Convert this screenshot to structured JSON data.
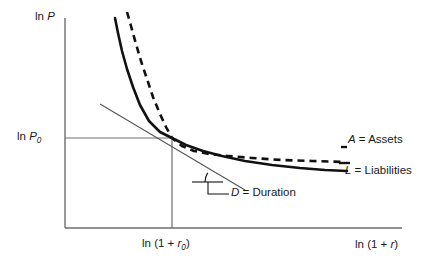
{
  "chart_data": {
    "type": "line",
    "title": "",
    "subtitle": "",
    "xlabel": "ln (1 + r)",
    "ylabel": "ln P",
    "xlim": [
      0,
      1
    ],
    "ylim": [
      0,
      1
    ],
    "grid": false,
    "legend_position": "right-inline",
    "axes": {
      "y_axis_label": "ln P",
      "x_axis_label": "ln (1 + r)",
      "y_tick_labels": [
        "ln P",
        "ln P_0"
      ],
      "x_tick_labels": [
        "ln (1 + r_0)",
        "ln (1 + r)"
      ],
      "origin_px": [
        65,
        228
      ],
      "x_axis_end_px": [
        402,
        228
      ],
      "y_axis_top_px": [
        65,
        18
      ]
    },
    "reference_lines": [
      {
        "name": "horizontal-price-reference",
        "label": "ln P_0",
        "from_px": [
          65,
          138
        ],
        "to_px": [
          172,
          138
        ],
        "style": "solid-thin"
      },
      {
        "name": "vertical-rate-reference",
        "label": "ln (1 + r_0)",
        "from_px": [
          172,
          138
        ],
        "to_px": [
          172,
          228
        ],
        "style": "solid-thin"
      }
    ],
    "series": [
      {
        "name": "A = Assets",
        "short": "A",
        "style": "dashed",
        "color": "#111111",
        "description": "Convex decreasing price-yield curve for assets",
        "points_px": [
          [
            127,
            12
          ],
          [
            131,
            26
          ],
          [
            136,
            44
          ],
          [
            141,
            61
          ],
          [
            147,
            79
          ],
          [
            153,
            97
          ],
          [
            160,
            114
          ],
          [
            166,
            127
          ],
          [
            172,
            138
          ],
          [
            182,
            146
          ],
          [
            194,
            151
          ],
          [
            209,
            154
          ],
          [
            228,
            156
          ],
          [
            252,
            158
          ],
          [
            282,
            160
          ],
          [
            312,
            161
          ],
          [
            345,
            162
          ]
        ]
      },
      {
        "name": "L = Liabilities",
        "short": "L",
        "style": "solid",
        "color": "#111111",
        "description": "Convex decreasing price-yield curve for liabilities, less convex than assets",
        "points_px": [
          [
            115,
            18
          ],
          [
            118,
            33
          ],
          [
            122,
            51
          ],
          [
            127,
            69
          ],
          [
            133,
            87
          ],
          [
            140,
            105
          ],
          [
            149,
            121
          ],
          [
            160,
            132
          ],
          [
            172,
            138
          ],
          [
            186,
            145
          ],
          [
            203,
            151
          ],
          [
            222,
            156
          ],
          [
            245,
            161
          ],
          [
            272,
            165
          ],
          [
            300,
            168
          ],
          [
            325,
            170
          ],
          [
            347,
            171
          ]
        ]
      }
    ],
    "tangent_line": {
      "name": "D = Duration",
      "short": "D",
      "description": "Tangent to the curves at the point (ln (1 + r_0), ln P_0); its slope equals duration",
      "from_px": [
        100,
        104
      ],
      "to_px": [
        245,
        190
      ],
      "style": "solid-thin"
    },
    "angle_marker": {
      "name": "duration-angle",
      "vertex_px": [
        222,
        182
      ],
      "horizontal_from_px": [
        192,
        182
      ],
      "arc_radius_px": 17
    },
    "annotations": [
      {
        "key": "y_axis_label",
        "text": "ln P",
        "x_px": 35,
        "y_px": 11
      },
      {
        "key": "y_tick_p0",
        "text": "ln P0",
        "x_px": 17,
        "y_px": 131
      },
      {
        "key": "x_tick_r0",
        "text": "ln (1 + r0)",
        "x_px": 142,
        "y_px": 238
      },
      {
        "key": "x_axis_label",
        "text": "ln (1 + r)",
        "x_px": 355,
        "y_px": 239
      },
      {
        "key": "assets_label",
        "text": "A = Assets",
        "x_px": 348,
        "y_px": 134
      },
      {
        "key": "liab_label",
        "text": "L = Liabilities",
        "x_px": 345,
        "y_px": 165
      },
      {
        "key": "duration_label",
        "text": "D = Duration",
        "x_px": 231,
        "y_px": 187
      }
    ]
  },
  "labels": {
    "y_axis": {
      "prefix": "ln ",
      "symbol": "P"
    },
    "y_tick_p0": {
      "prefix": "ln ",
      "symbol": "P",
      "sub": "0"
    },
    "x_tick_r0": {
      "pre": "ln (1 + ",
      "symbol": "r",
      "sub": "0",
      "post": ")"
    },
    "x_axis": {
      "pre": "ln (1 + ",
      "symbol": "r",
      "post": ")"
    },
    "assets": {
      "symbol": "A",
      "text": " = Assets"
    },
    "liabilities": {
      "symbol": "L",
      "text": " = Liabilities"
    },
    "duration": {
      "symbol": "D",
      "text": " = Duration"
    }
  },
  "colors": {
    "axis": "#6e6e6e",
    "curve": "#111111",
    "reference": "#6e6e6e",
    "tangent": "#555555",
    "text": "#1a1a1a",
    "background": "#ffffff"
  }
}
